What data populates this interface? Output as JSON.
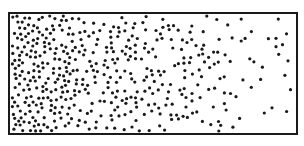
{
  "diagram": {
    "type": "particle-concentration-gradient",
    "box": {
      "x": 9,
      "y": 13,
      "width": 288,
      "height": 121,
      "stroke": "#1a1a1a",
      "stroke_width": 2
    },
    "dots": {
      "color": "#1a1a1a",
      "radius": 1.6,
      "seed": 7,
      "density_bands": [
        {
          "x_from": 0.0,
          "x_to": 0.1,
          "count": 95
        },
        {
          "x_from": 0.1,
          "x_to": 0.25,
          "count": 110
        },
        {
          "x_from": 0.25,
          "x_to": 0.45,
          "count": 105
        },
        {
          "x_from": 0.45,
          "x_to": 0.65,
          "count": 80
        },
        {
          "x_from": 0.65,
          "x_to": 0.82,
          "count": 45
        },
        {
          "x_from": 0.82,
          "x_to": 1.0,
          "count": 20
        }
      ],
      "gradient_direction": "high-left-to-low-right"
    }
  }
}
